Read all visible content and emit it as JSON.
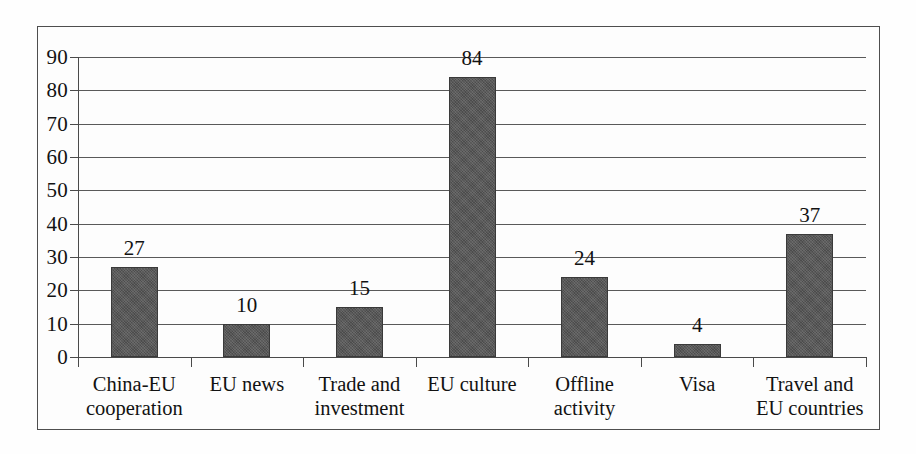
{
  "chart_data": {
    "type": "bar",
    "title": "",
    "subtitle": "",
    "xlabel": "",
    "ylabel": "",
    "categories": [
      "China-EU\ncooperation",
      "EU news",
      "Trade and\ninvestment",
      "EU culture",
      "Offline\nactivity",
      "Visa",
      "Travel and\nEU countries"
    ],
    "values": [
      27,
      10,
      15,
      84,
      24,
      4,
      37
    ],
    "value_labels": [
      "27",
      "10",
      "15",
      "84",
      "24",
      "4",
      "37"
    ],
    "ylim": [
      0,
      90
    ],
    "ytick_values": [
      0,
      10,
      20,
      30,
      40,
      50,
      60,
      70,
      80,
      90
    ],
    "ytick_labels": [
      "0",
      "10",
      "20",
      "30",
      "40",
      "50",
      "60",
      "70",
      "80",
      "90"
    ],
    "grid": "horizontal",
    "legend": "none",
    "bar_color": "#4c4c4c",
    "grid_color": "#595959",
    "axis_color": "#4a4a4a",
    "frame_color": "#4e4e4e",
    "background_color": "#fdfdfd",
    "text_color": "#121212"
  }
}
